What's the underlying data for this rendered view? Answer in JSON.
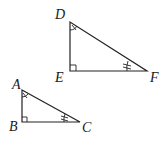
{
  "figure": {
    "triangles": [
      {
        "name": "DEF",
        "vertices": {
          "D": [
            70,
            22
          ],
          "E": [
            70,
            71
          ],
          "F": [
            147,
            71
          ]
        },
        "labels": {
          "D": "D",
          "E": "E",
          "F": "F"
        },
        "right_angle_at": "E",
        "single_arc_at": "D",
        "double_arc_at": "F"
      },
      {
        "name": "ABC",
        "vertices": {
          "A": [
            22,
            90
          ],
          "B": [
            22,
            122
          ],
          "C": [
            80,
            122
          ]
        },
        "labels": {
          "A": "A",
          "B": "B",
          "C": "C"
        },
        "right_angle_at": "B",
        "single_arc_at": "A",
        "double_arc_at": "C"
      }
    ],
    "colors": {
      "stroke": "#222222",
      "background": "#ffffff"
    }
  }
}
